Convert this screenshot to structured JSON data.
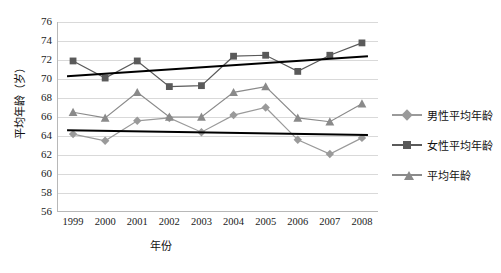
{
  "chart_data": {
    "type": "line",
    "title": "",
    "xlabel": "年份",
    "ylabel": "平均年龄（岁）",
    "categories": [
      "1999",
      "2000",
      "2001",
      "2002",
      "2003",
      "2004",
      "2005",
      "2006",
      "2007",
      "2008"
    ],
    "x": [
      1999,
      2000,
      2001,
      2002,
      2003,
      2004,
      2005,
      2006,
      2007,
      2008
    ],
    "ylim": [
      56,
      76
    ],
    "ytick_step": 2,
    "yticks": [
      56,
      58,
      60,
      62,
      64,
      66,
      68,
      70,
      72,
      74,
      76
    ],
    "grid": true,
    "legend_position": "right",
    "series": [
      {
        "name": "男性平均年龄",
        "marker": "diamond",
        "color": "#9a9a9a",
        "values": [
          64.2,
          63.5,
          65.6,
          65.9,
          64.4,
          66.2,
          67.0,
          63.6,
          62.1,
          63.8
        ],
        "trendline": {
          "start": 64.6,
          "end": 64.1,
          "color": "#000000"
        }
      },
      {
        "name": "女性平均年龄",
        "marker": "square",
        "color": "#5a5a5a",
        "values": [
          71.9,
          70.1,
          71.9,
          69.2,
          69.3,
          72.4,
          72.5,
          70.8,
          72.5,
          73.8
        ],
        "trendline": {
          "start": 70.3,
          "end": 72.4,
          "color": "#000000"
        }
      },
      {
        "name": "平均年龄",
        "marker": "triangle",
        "color": "#8a8a8a",
        "values": [
          66.5,
          65.9,
          68.6,
          66.0,
          66.0,
          68.6,
          69.2,
          65.9,
          65.5,
          67.4
        ]
      }
    ]
  },
  "axis": {
    "y_labels": [
      "76",
      "74",
      "72",
      "70",
      "68",
      "66",
      "64",
      "62",
      "60",
      "58",
      "56"
    ],
    "x_labels": [
      "1999",
      "2000",
      "2001",
      "2002",
      "2003",
      "2004",
      "2005",
      "2006",
      "2007",
      "2008"
    ],
    "x_title": "年份",
    "y_title": "平均年龄（岁）"
  },
  "legend": {
    "items": [
      {
        "label": "男性平均年龄",
        "marker": "diamond",
        "color": "#9a9a9a"
      },
      {
        "label": "女性平均年龄",
        "marker": "square",
        "color": "#5a5a5a"
      },
      {
        "label": "平均年龄",
        "marker": "triangle",
        "color": "#8a8a8a"
      }
    ]
  }
}
